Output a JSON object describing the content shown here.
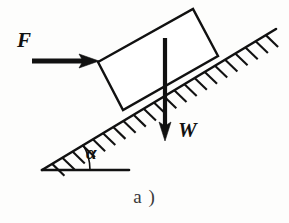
{
  "figure": {
    "caption": "a )",
    "canvas": {
      "width": 289,
      "height": 223,
      "background": "#fdfdfc"
    },
    "ink_color": "#111111",
    "labels": {
      "force_F": "F",
      "weight_W": "W",
      "angle_alpha": "α"
    },
    "geometry": {
      "incline": {
        "name": "inclined-surface-line",
        "from": [
          42,
          170
        ],
        "to": [
          276,
          29
        ],
        "angle_degrees": 31,
        "stroke_width": 2.6
      },
      "ground": {
        "name": "horizontal-baseline",
        "from": [
          42,
          170
        ],
        "to": [
          129,
          170
        ],
        "stroke_width": 2.6
      },
      "angle_arc": {
        "name": "angle-arc",
        "vertex": [
          42,
          170
        ],
        "radius": 48,
        "stroke_width": 1.6
      },
      "block": {
        "name": "block-body",
        "points": [
          [
            98,
            62
          ],
          [
            193,
            9
          ],
          [
            218,
            56
          ],
          [
            123,
            110
          ]
        ],
        "stroke_width": 2.4
      },
      "force_arrow": {
        "name": "force-arrow-F",
        "from": [
          32,
          61
        ],
        "to": [
          99,
          61
        ],
        "shaft_width": 5,
        "head_length": 20,
        "head_width": 16
      },
      "weight_arrow": {
        "name": "weight-arrow-W",
        "from": [
          165,
          38
        ],
        "to": [
          165,
          141
        ],
        "shaft_width": 4,
        "head_length": 18,
        "head_width": 13
      },
      "hatching": {
        "name": "incline-hatching",
        "tick_count": 22,
        "tick_length": 17,
        "tick_angle_degrees": 75,
        "stroke_width": 2.1
      }
    }
  }
}
